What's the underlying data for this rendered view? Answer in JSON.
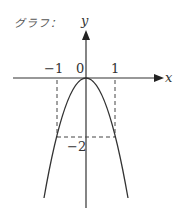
{
  "title": "グラフ：",
  "axes": {
    "x_label": "x",
    "y_label": "y"
  },
  "ticks": {
    "x_neg1": "−1",
    "x_pos1": "1",
    "origin": "0",
    "y_neg2": "−2"
  },
  "curve": {
    "equation": "y = -2x^2",
    "vertex": [
      0,
      0
    ],
    "passes_through": [
      [
        -1,
        -2
      ],
      [
        1,
        -2
      ]
    ]
  },
  "colors": {
    "line": "#333333",
    "dash": "#444444"
  }
}
